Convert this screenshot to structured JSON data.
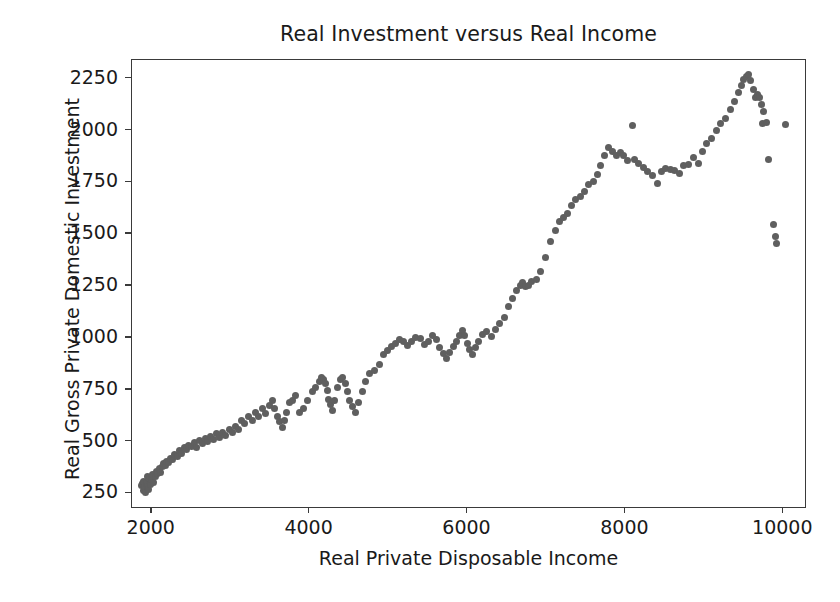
{
  "chart_data": {
    "type": "scatter",
    "title": "Real Investment versus Real Income",
    "xlabel": "Real Private Disposable Income",
    "ylabel": "Real Gross Private Domestic Investment",
    "xlim": [
      1750,
      10300
    ],
    "ylim": [
      175,
      2340
    ],
    "xticks": [
      2000,
      4000,
      6000,
      8000,
      10000
    ],
    "xtick_labels": [
      "2000",
      "4000",
      "6000",
      "8000",
      "10000"
    ],
    "yticks": [
      250,
      500,
      750,
      1000,
      1250,
      1500,
      1750,
      2000,
      2250
    ],
    "ytick_labels": [
      "250",
      "500",
      "750",
      "1000",
      "1250",
      "1500",
      "1750",
      "2000",
      "2250"
    ],
    "grid": false,
    "legend": null,
    "marker": {
      "shape": "circle",
      "color": "#5f5f5f",
      "size": 7
    },
    "series": [
      {
        "name": "Real Investment vs Real Income",
        "points": [
          [
            1875,
            290
          ],
          [
            1885,
            300
          ],
          [
            1895,
            265
          ],
          [
            1900,
            310
          ],
          [
            1910,
            280
          ],
          [
            1920,
            255
          ],
          [
            1930,
            300
          ],
          [
            1940,
            330
          ],
          [
            1950,
            285
          ],
          [
            1960,
            270
          ],
          [
            1975,
            320
          ],
          [
            1990,
            295
          ],
          [
            2000,
            315
          ],
          [
            2010,
            340
          ],
          [
            2025,
            305
          ],
          [
            2045,
            330
          ],
          [
            2060,
            355
          ],
          [
            2075,
            345
          ],
          [
            2095,
            370
          ],
          [
            2110,
            350
          ],
          [
            2130,
            380
          ],
          [
            2150,
            395
          ],
          [
            2170,
            385
          ],
          [
            2190,
            405
          ],
          [
            2215,
            400
          ],
          [
            2240,
            420
          ],
          [
            2265,
            415
          ],
          [
            2290,
            440
          ],
          [
            2320,
            430
          ],
          [
            2350,
            455
          ],
          [
            2380,
            445
          ],
          [
            2410,
            470
          ],
          [
            2440,
            460
          ],
          [
            2470,
            480
          ],
          [
            2505,
            475
          ],
          [
            2540,
            495
          ],
          [
            2570,
            470
          ],
          [
            2605,
            505
          ],
          [
            2640,
            490
          ],
          [
            2675,
            515
          ],
          [
            2710,
            500
          ],
          [
            2745,
            525
          ],
          [
            2780,
            510
          ],
          [
            2820,
            540
          ],
          [
            2860,
            520
          ],
          [
            2900,
            545
          ],
          [
            2940,
            530
          ],
          [
            2980,
            560
          ],
          [
            3020,
            545
          ],
          [
            3060,
            575
          ],
          [
            3100,
            560
          ],
          [
            3140,
            600
          ],
          [
            3180,
            585
          ],
          [
            3225,
            620
          ],
          [
            3270,
            600
          ],
          [
            3310,
            640
          ],
          [
            3355,
            620
          ],
          [
            3400,
            660
          ],
          [
            3445,
            635
          ],
          [
            3490,
            675
          ],
          [
            3530,
            700
          ],
          [
            3560,
            660
          ],
          [
            3590,
            620
          ],
          [
            3620,
            595
          ],
          [
            3650,
            570
          ],
          [
            3680,
            600
          ],
          [
            3710,
            640
          ],
          [
            3745,
            690
          ],
          [
            3780,
            700
          ],
          [
            3820,
            720
          ],
          [
            3870,
            640
          ],
          [
            3920,
            660
          ],
          [
            3975,
            700
          ],
          [
            4030,
            740
          ],
          [
            4080,
            760
          ],
          [
            4120,
            790
          ],
          [
            4150,
            810
          ],
          [
            4175,
            800
          ],
          [
            4200,
            780
          ],
          [
            4220,
            745
          ],
          [
            4245,
            705
          ],
          [
            4270,
            680
          ],
          [
            4295,
            650
          ],
          [
            4320,
            700
          ],
          [
            4350,
            760
          ],
          [
            4385,
            800
          ],
          [
            4420,
            810
          ],
          [
            4450,
            780
          ],
          [
            4480,
            740
          ],
          [
            4510,
            700
          ],
          [
            4545,
            670
          ],
          [
            4580,
            640
          ],
          [
            4620,
            690
          ],
          [
            4665,
            740
          ],
          [
            4710,
            790
          ],
          [
            4760,
            830
          ],
          [
            4820,
            845
          ],
          [
            4880,
            870
          ],
          [
            4940,
            920
          ],
          [
            4990,
            940
          ],
          [
            5040,
            960
          ],
          [
            5090,
            975
          ],
          [
            5140,
            990
          ],
          [
            5190,
            985
          ],
          [
            5240,
            965
          ],
          [
            5290,
            985
          ],
          [
            5345,
            1000
          ],
          [
            5400,
            995
          ],
          [
            5455,
            970
          ],
          [
            5505,
            985
          ],
          [
            5555,
            1010
          ],
          [
            5605,
            990
          ],
          [
            5650,
            955
          ],
          [
            5695,
            925
          ],
          [
            5735,
            900
          ],
          [
            5775,
            930
          ],
          [
            5820,
            960
          ],
          [
            5865,
            985
          ],
          [
            5900,
            1010
          ],
          [
            5935,
            1035
          ],
          [
            5965,
            1010
          ],
          [
            5995,
            975
          ],
          [
            6025,
            945
          ],
          [
            6060,
            920
          ],
          [
            6100,
            955
          ],
          [
            6145,
            985
          ],
          [
            6195,
            1015
          ],
          [
            6245,
            1030
          ],
          [
            6300,
            1005
          ],
          [
            6355,
            1040
          ],
          [
            6410,
            1070
          ],
          [
            6465,
            1100
          ],
          [
            6520,
            1150
          ],
          [
            6575,
            1190
          ],
          [
            6625,
            1230
          ],
          [
            6665,
            1255
          ],
          [
            6700,
            1265
          ],
          [
            6735,
            1250
          ],
          [
            6770,
            1255
          ],
          [
            6815,
            1270
          ],
          [
            6870,
            1280
          ],
          [
            6930,
            1320
          ],
          [
            6990,
            1390
          ],
          [
            7050,
            1465
          ],
          [
            7110,
            1520
          ],
          [
            7165,
            1560
          ],
          [
            7215,
            1580
          ],
          [
            7265,
            1600
          ],
          [
            7315,
            1640
          ],
          [
            7370,
            1665
          ],
          [
            7425,
            1680
          ],
          [
            7480,
            1705
          ],
          [
            7535,
            1740
          ],
          [
            7590,
            1755
          ],
          [
            7640,
            1790
          ],
          [
            7690,
            1830
          ],
          [
            7740,
            1880
          ],
          [
            7790,
            1920
          ],
          [
            7840,
            1900
          ],
          [
            7890,
            1880
          ],
          [
            7935,
            1895
          ],
          [
            7980,
            1880
          ],
          [
            8030,
            1855
          ],
          [
            8090,
            2025
          ],
          [
            8120,
            1860
          ],
          [
            8170,
            1840
          ],
          [
            8230,
            1820
          ],
          [
            8285,
            1800
          ],
          [
            8340,
            1785
          ],
          [
            8400,
            1745
          ],
          [
            8455,
            1800
          ],
          [
            8510,
            1815
          ],
          [
            8565,
            1810
          ],
          [
            8620,
            1805
          ],
          [
            8680,
            1795
          ],
          [
            8740,
            1830
          ],
          [
            8800,
            1835
          ],
          [
            8860,
            1870
          ],
          [
            8920,
            1840
          ],
          [
            8975,
            1900
          ],
          [
            9030,
            1935
          ],
          [
            9090,
            1960
          ],
          [
            9150,
            2000
          ],
          [
            9210,
            2035
          ],
          [
            9265,
            2060
          ],
          [
            9325,
            2100
          ],
          [
            9380,
            2140
          ],
          [
            9430,
            2185
          ],
          [
            9470,
            2215
          ],
          [
            9500,
            2245
          ],
          [
            9535,
            2260
          ],
          [
            9560,
            2270
          ],
          [
            9590,
            2240
          ],
          [
            9620,
            2200
          ],
          [
            9650,
            2160
          ],
          [
            9675,
            2175
          ],
          [
            9700,
            2160
          ],
          [
            9720,
            2125
          ],
          [
            9730,
            2035
          ],
          [
            9755,
            2090
          ],
          [
            9790,
            2040
          ],
          [
            9815,
            1860
          ],
          [
            9870,
            1545
          ],
          [
            9905,
            1490
          ],
          [
            9915,
            1455
          ],
          [
            10030,
            2030
          ]
        ]
      }
    ]
  }
}
